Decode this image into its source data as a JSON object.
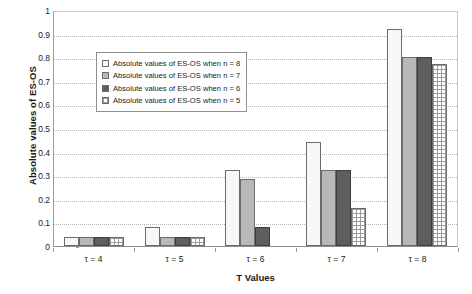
{
  "chart_data": {
    "type": "bar",
    "title": "",
    "xlabel": "T Values",
    "ylabel": "Absolute values of ES-OS",
    "categories": [
      "τ = 4",
      "τ = 5",
      "τ = 6",
      "τ = 7",
      "τ = 8"
    ],
    "series": [
      {
        "name": "Absolute values of ES-OS when n = 8",
        "values": [
          0.04,
          0.08,
          0.32,
          0.44,
          0.92
        ]
      },
      {
        "name": "Absolute values of ES-OS when n = 7",
        "values": [
          0.04,
          0.04,
          0.285,
          0.32,
          0.8
        ]
      },
      {
        "name": "Absolute values of ES-OS when n = 6",
        "values": [
          0.04,
          0.04,
          0.08,
          0.32,
          0.8
        ]
      },
      {
        "name": "Absolute values of ES-OS when n = 5",
        "values": [
          0.04,
          0.04,
          0.0,
          0.16,
          0.77
        ]
      }
    ],
    "ylim": [
      0,
      1
    ],
    "yticks": [
      "0",
      "0.1",
      "0.2",
      "0.3",
      "0.4",
      "0.5",
      "0.6",
      "0.7",
      "0.8",
      "0.9",
      "1"
    ],
    "grid": true,
    "legend_position": "upper-left-inside",
    "colors": {
      "series1": "#f7f7f7",
      "series2": "#b8b8b8",
      "series3": "#5e5e5e",
      "series4": "#ffffff",
      "gridline": "#b6b6b6",
      "axis": "#8d8d8d",
      "text": "#1a1a1a"
    }
  }
}
